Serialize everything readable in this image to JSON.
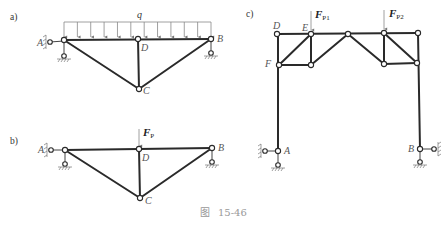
{
  "figure": {
    "caption_prefix": "图",
    "caption_number": "15-46"
  },
  "panels": [
    {
      "id": "a",
      "label": "a)",
      "load": {
        "type": "distributed",
        "symbol": "q"
      },
      "nodes": {
        "A": "A",
        "B": "B",
        "C": "C",
        "D": "D"
      }
    },
    {
      "id": "b",
      "label": "b)",
      "load": {
        "type": "point",
        "symbol": "F",
        "subscript": "P"
      },
      "nodes": {
        "A": "A",
        "B": "B",
        "C": "C",
        "D": "D"
      }
    },
    {
      "id": "c",
      "label": "c)",
      "loads": [
        {
          "symbol": "F",
          "subscript": "P1"
        },
        {
          "symbol": "F",
          "subscript": "P2"
        }
      ],
      "nodes": {
        "A": "A",
        "B": "B",
        "D": "D",
        "E": "E",
        "F": "F"
      }
    }
  ]
}
